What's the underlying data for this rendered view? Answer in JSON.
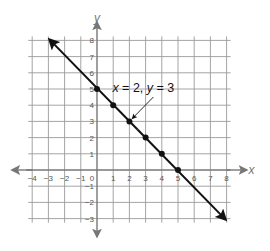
{
  "chart_data": {
    "type": "line",
    "title": "",
    "xlabel": "x",
    "ylabel": "y",
    "xlim": [
      -4,
      8
    ],
    "ylim": [
      -3,
      8
    ],
    "grid": true,
    "x_ticks": [
      -4,
      -3,
      -2,
      -1,
      0,
      1,
      2,
      3,
      4,
      5,
      6,
      7,
      8
    ],
    "y_ticks": [
      -3,
      -2,
      -1,
      1,
      2,
      3,
      4,
      5,
      6,
      7,
      8
    ],
    "series": [
      {
        "name": "x + y = 5",
        "line_from": {
          "x": -3,
          "y": 8
        },
        "line_to": {
          "x": 8,
          "y": -3
        },
        "arrows_both_ends": true,
        "points": [
          {
            "x": 0,
            "y": 5
          },
          {
            "x": 1,
            "y": 4
          },
          {
            "x": 2,
            "y": 3
          },
          {
            "x": 3,
            "y": 2
          },
          {
            "x": 4,
            "y": 1
          },
          {
            "x": 5,
            "y": 0
          }
        ]
      }
    ],
    "annotations": [
      {
        "text_parts": [
          "x",
          " = 2, ",
          "y",
          " = 3"
        ],
        "text": "x = 2, y = 3",
        "points_to": {
          "x": 2,
          "y": 3
        }
      }
    ]
  },
  "colors": {
    "grid": "#9a9a9a",
    "axis": "#777777",
    "line": "#111111"
  }
}
